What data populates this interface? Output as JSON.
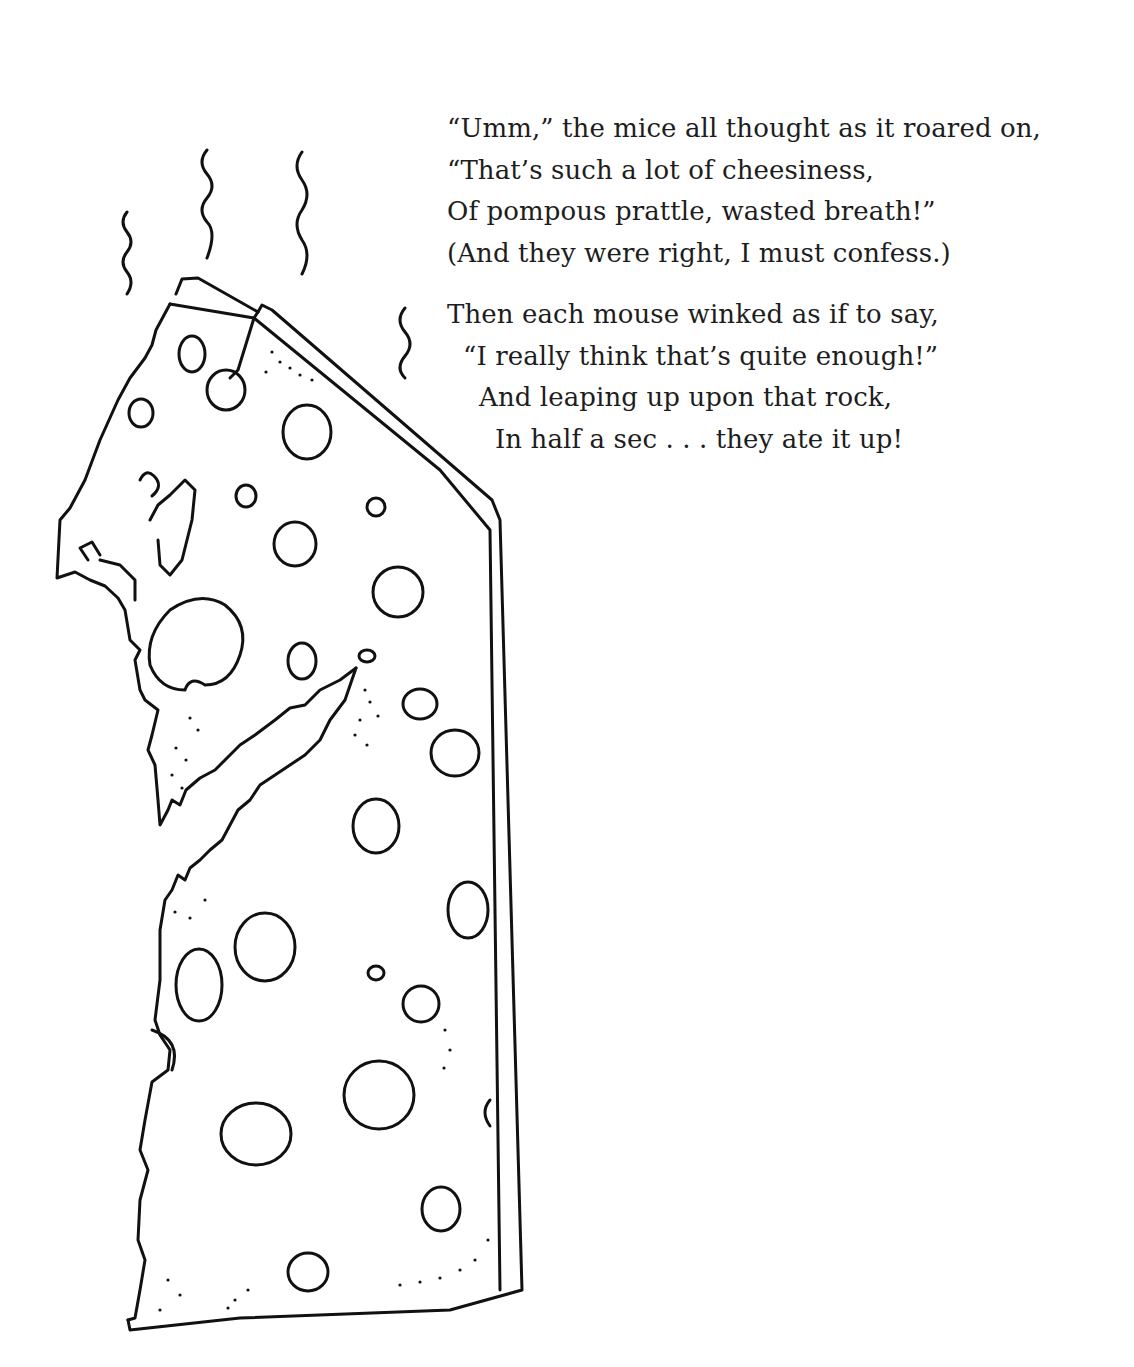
{
  "poem": {
    "stanzas": [
      {
        "lines": [
          "“Umm,” the mice all thought as it roared on,",
          "“That’s such a lot of cheesiness,",
          "Of pompous prattle, wasted breath!”",
          "(And they were right, I must confess.)"
        ]
      },
      {
        "lines": [
          "Then each mouse winked as if to say,",
          "“I really think that’s quite enough!”",
          "And leaping up upon that rock,",
          "In half a sec . . . they ate it up!"
        ]
      }
    ]
  },
  "illustration": {
    "subject": "cheese-wedge-with-holes-and-bite-marks",
    "stink_lines": 4,
    "ink_color": "#111111",
    "paper_color": "#ffffff"
  }
}
